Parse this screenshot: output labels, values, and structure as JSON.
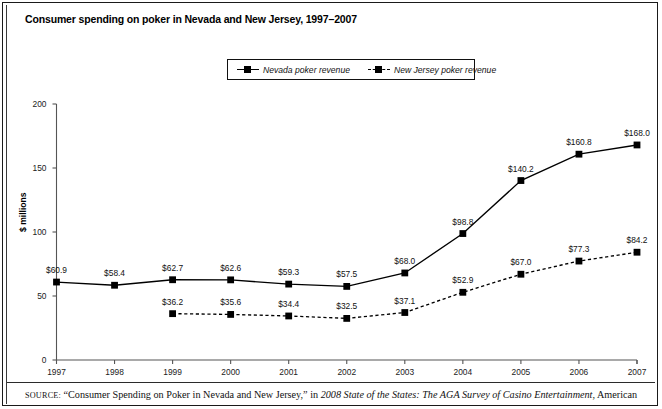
{
  "figure": {
    "title": "Consumer spending on poker in Nevada and New Jersey, 1997–2007",
    "source_prefix": "SOURCE:",
    "source_quote": "“Consumer Spending on Poker in Nevada and New Jersey,”",
    "source_in": "in",
    "source_italic": "2008 State of the States: The AGA Survey of Casino Entertainment",
    "source_tail": ", American"
  },
  "legend": {
    "position": "top-center",
    "items": [
      {
        "label": "Nevada poker revenue",
        "style": "solid",
        "marker": "square",
        "color": "#000000"
      },
      {
        "label": "New Jersey poker revenue",
        "style": "dashed",
        "marker": "square",
        "color": "#000000"
      }
    ]
  },
  "chart_data": {
    "type": "line",
    "title": "Consumer spending on poker in Nevada and New Jersey, 1997–2007",
    "xlabel": "",
    "ylabel": "$ millions",
    "x": [
      "1997",
      "1998",
      "1999",
      "2000",
      "2001",
      "2002",
      "2003",
      "2004",
      "2005",
      "2006",
      "2007"
    ],
    "categories": [
      "1997",
      "1998",
      "1999",
      "2000",
      "2001",
      "2002",
      "2003",
      "2004",
      "2005",
      "2006",
      "2007"
    ],
    "xlim": [
      1997,
      2007
    ],
    "ylim": [
      0,
      200
    ],
    "yticks": [
      0,
      50,
      100,
      150,
      200
    ],
    "ytick_labels": [
      "0",
      "50",
      "100",
      "150",
      "200"
    ],
    "grid": false,
    "legend_position": "top-center",
    "series": [
      {
        "name": "Nevada poker revenue",
        "style": "solid",
        "marker": "square",
        "color": "#000000",
        "values": [
          60.9,
          58.4,
          62.7,
          62.6,
          59.3,
          57.5,
          68.0,
          98.8,
          140.2,
          160.8,
          168.0
        ],
        "data_labels": [
          "$60.9",
          "$58.4",
          "$62.7",
          "$62.6",
          "$59.3",
          "$57.5",
          "$68.0",
          "$98.8",
          "$140.2",
          "$160.8",
          "$168.0"
        ]
      },
      {
        "name": "New Jersey poker revenue",
        "style": "dashed",
        "marker": "square",
        "color": "#000000",
        "values": [
          null,
          null,
          36.2,
          35.6,
          34.4,
          32.5,
          37.1,
          52.9,
          67.0,
          77.3,
          84.2
        ],
        "data_labels": [
          "",
          "",
          "$36.2",
          "$35.6",
          "$34.4",
          "$32.5",
          "$37.1",
          "$52.9",
          "$67.0",
          "$77.3",
          "$84.2"
        ]
      }
    ]
  }
}
